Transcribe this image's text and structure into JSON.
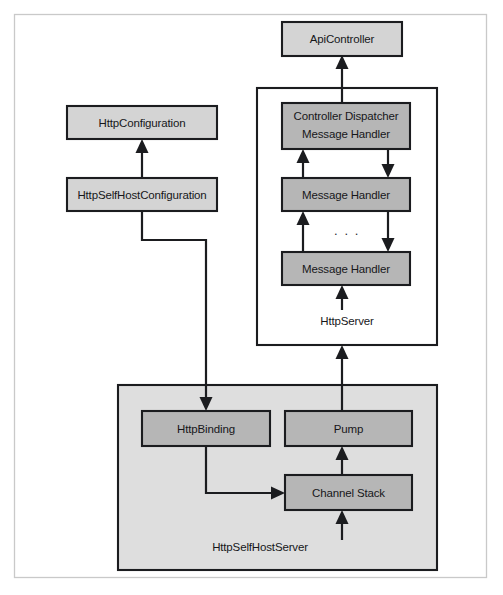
{
  "figure": {
    "background_color": "#ffffff",
    "frame": {
      "name": "outer-frame",
      "x": 14,
      "y": 14,
      "width": 473,
      "height": 564,
      "stroke_color": "#c9c9c9"
    },
    "colors": {
      "node_fill_light": "#d4d4d4",
      "node_fill_medium": "#b6b6b6",
      "container_fill": "#dedede",
      "container_fill_white": "#ffffff",
      "stroke": "#1b1c1f",
      "text": "#16171a",
      "frame_stroke": "#c9c9c9"
    }
  },
  "nodes": [
    {
      "id": "api-controller",
      "label": "ApiController",
      "x": 282,
      "y": 22,
      "width": 120,
      "height": 34,
      "fill": "#d4d4d4"
    },
    {
      "id": "http-configuration",
      "label": "HttpConfiguration",
      "x": 67,
      "y": 106,
      "width": 150,
      "height": 33,
      "fill": "#d4d4d4"
    },
    {
      "id": "http-self-host-configuration",
      "label": "HttpSelfHostConfiguration",
      "x": 67,
      "y": 178,
      "width": 150,
      "height": 33,
      "fill": "#d4d4d4"
    },
    {
      "id": "controller-dispatcher-message-handler",
      "label_line1": "Controller Dispatcher",
      "label_line2": "Message Handler",
      "x": 282,
      "y": 103,
      "width": 128,
      "height": 46,
      "fill": "#b6b6b6"
    },
    {
      "id": "message-handler-1",
      "label": "Message Handler",
      "x": 282,
      "y": 178,
      "width": 128,
      "height": 33,
      "fill": "#b6b6b6"
    },
    {
      "id": "message-handler-2",
      "label": "Message Handler",
      "x": 282,
      "y": 252,
      "width": 128,
      "height": 33,
      "fill": "#b6b6b6"
    },
    {
      "id": "http-binding",
      "label": "HttpBinding",
      "x": 142,
      "y": 411,
      "width": 128,
      "height": 35,
      "fill": "#b6b6b6"
    },
    {
      "id": "pump",
      "label": "Pump",
      "x": 285,
      "y": 411,
      "width": 127,
      "height": 35,
      "fill": "#b6b6b6"
    },
    {
      "id": "channel-stack",
      "label": "Channel Stack",
      "x": 285,
      "y": 475,
      "width": 127,
      "height": 35,
      "fill": "#b6b6b6"
    }
  ],
  "containers": [
    {
      "id": "http-server",
      "label": "HttpServer",
      "x": 257,
      "y": 88,
      "width": 180,
      "height": 257,
      "fill": "#ffffff",
      "label_x": 347,
      "label_y": 322
    },
    {
      "id": "http-self-host-server",
      "label": "HttpSelfHostServer",
      "x": 118,
      "y": 385,
      "width": 319,
      "height": 185,
      "fill": "#dedede",
      "label_x": 260,
      "label_y": 548
    }
  ],
  "ellipsis": {
    "id": "handler-chain-ellipsis",
    "label": ". . .",
    "x": 347,
    "y": 232
  },
  "connectors": [
    {
      "id": "handlers-to-api-controller",
      "from": "controller-dispatcher-message-handler",
      "to": "api-controller",
      "direction": "up"
    },
    {
      "id": "selfhostconfig-to-httpconfig",
      "from": "http-self-host-configuration",
      "to": "http-configuration",
      "direction": "up"
    },
    {
      "id": "selfhostconfig-to-httpbinding",
      "from": "http-self-host-configuration",
      "to": "http-binding",
      "direction": "down"
    },
    {
      "id": "handler1-to-dispatcher",
      "from": "message-handler-1",
      "to": "controller-dispatcher-message-handler",
      "direction": "up"
    },
    {
      "id": "dispatcher-to-handler1",
      "from": "controller-dispatcher-message-handler",
      "to": "message-handler-1",
      "direction": "down"
    },
    {
      "id": "handler2-to-handler1",
      "from": "message-handler-2",
      "to": "message-handler-1",
      "direction": "up"
    },
    {
      "id": "handler1-to-handler2",
      "from": "message-handler-1",
      "to": "message-handler-2",
      "direction": "down"
    },
    {
      "id": "server-entry-to-handler2",
      "from": "http-server-boundary",
      "to": "message-handler-2",
      "direction": "up"
    },
    {
      "id": "pump-to-http-server",
      "from": "pump",
      "to": "http-server",
      "direction": "up"
    },
    {
      "id": "httpbinding-to-channel-stack",
      "from": "http-binding",
      "to": "channel-stack",
      "direction": "right"
    },
    {
      "id": "channel-stack-to-pump",
      "from": "channel-stack",
      "to": "pump",
      "direction": "up"
    },
    {
      "id": "network-to-channel-stack",
      "from": "network",
      "to": "channel-stack",
      "direction": "up"
    }
  ]
}
